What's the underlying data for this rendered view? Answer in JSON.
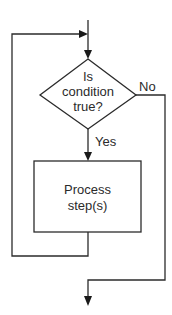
{
  "diagram": {
    "type": "flowchart",
    "colors": {
      "stroke": "#2b2b2b",
      "background": "#ffffff",
      "text": "#2b2b2b"
    },
    "decision": {
      "shape": "diamond",
      "lines": [
        "Is",
        "condition",
        "true?"
      ]
    },
    "process": {
      "shape": "rectangle",
      "lines": [
        "Process",
        "step(s)"
      ]
    },
    "branches": {
      "yes_label": "Yes",
      "no_label": "No"
    },
    "edges": [
      {
        "from": "entry",
        "to": "decision"
      },
      {
        "from": "decision",
        "to": "process",
        "label": "Yes"
      },
      {
        "from": "process",
        "to": "decision",
        "note": "loop back"
      },
      {
        "from": "decision",
        "to": "exit",
        "label": "No"
      }
    ]
  }
}
